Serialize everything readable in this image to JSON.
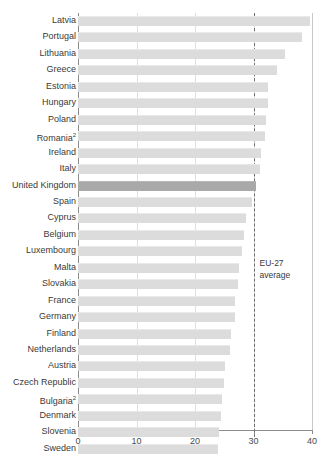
{
  "top_fragment": "",
  "chart_data": {
    "type": "bar",
    "orientation": "horizontal",
    "title": "",
    "subtitle": "",
    "xlabel": "",
    "ylabel": "",
    "xlim": [
      0,
      40
    ],
    "xticks": [
      0,
      10,
      20,
      30,
      40
    ],
    "xticklabels": [
      "0",
      "10",
      "20",
      "30",
      "40"
    ],
    "grid": true,
    "grid_axis": "x",
    "legend": "none",
    "highlight_category": "United Kingdom",
    "colors": {
      "bar": "#dcdcdc",
      "bar_highlight": "#a9a9a9",
      "grid": "#dedede",
      "axis": "#8c8c8c",
      "reference_line": "#6d6d6d",
      "text": "#3a3a3a"
    },
    "categories": [
      "Latvia",
      "Portugal",
      "Lithuania",
      "Greece",
      "Estonia",
      "Hungary",
      "Poland",
      "Romania",
      "Ireland",
      "Italy",
      "United Kingdom",
      "Spain",
      "Cyprus",
      "Belgium",
      "Luxembourg",
      "Malta",
      "Slovakia",
      "France",
      "Germany",
      "Finland",
      "Netherlands",
      "Austria",
      "Czech Republic",
      "Bulgaria",
      "Denmark",
      "Slovenia",
      "Sweden"
    ],
    "category_footnotes": {
      "Romania": "2",
      "Bulgaria": "2"
    },
    "values": [
      39.6,
      38.3,
      35.4,
      34.0,
      32.5,
      32.5,
      32.1,
      32.0,
      31.3,
      31.1,
      30.5,
      29.8,
      28.8,
      28.3,
      28.0,
      27.6,
      27.3,
      26.9,
      26.8,
      26.2,
      26.0,
      25.1,
      24.9,
      24.6,
      24.4,
      24.1,
      23.9
    ],
    "reference_line": {
      "value": 30.0,
      "label_line1": "EU-27",
      "label_line2": "average",
      "style": "dashed"
    }
  }
}
